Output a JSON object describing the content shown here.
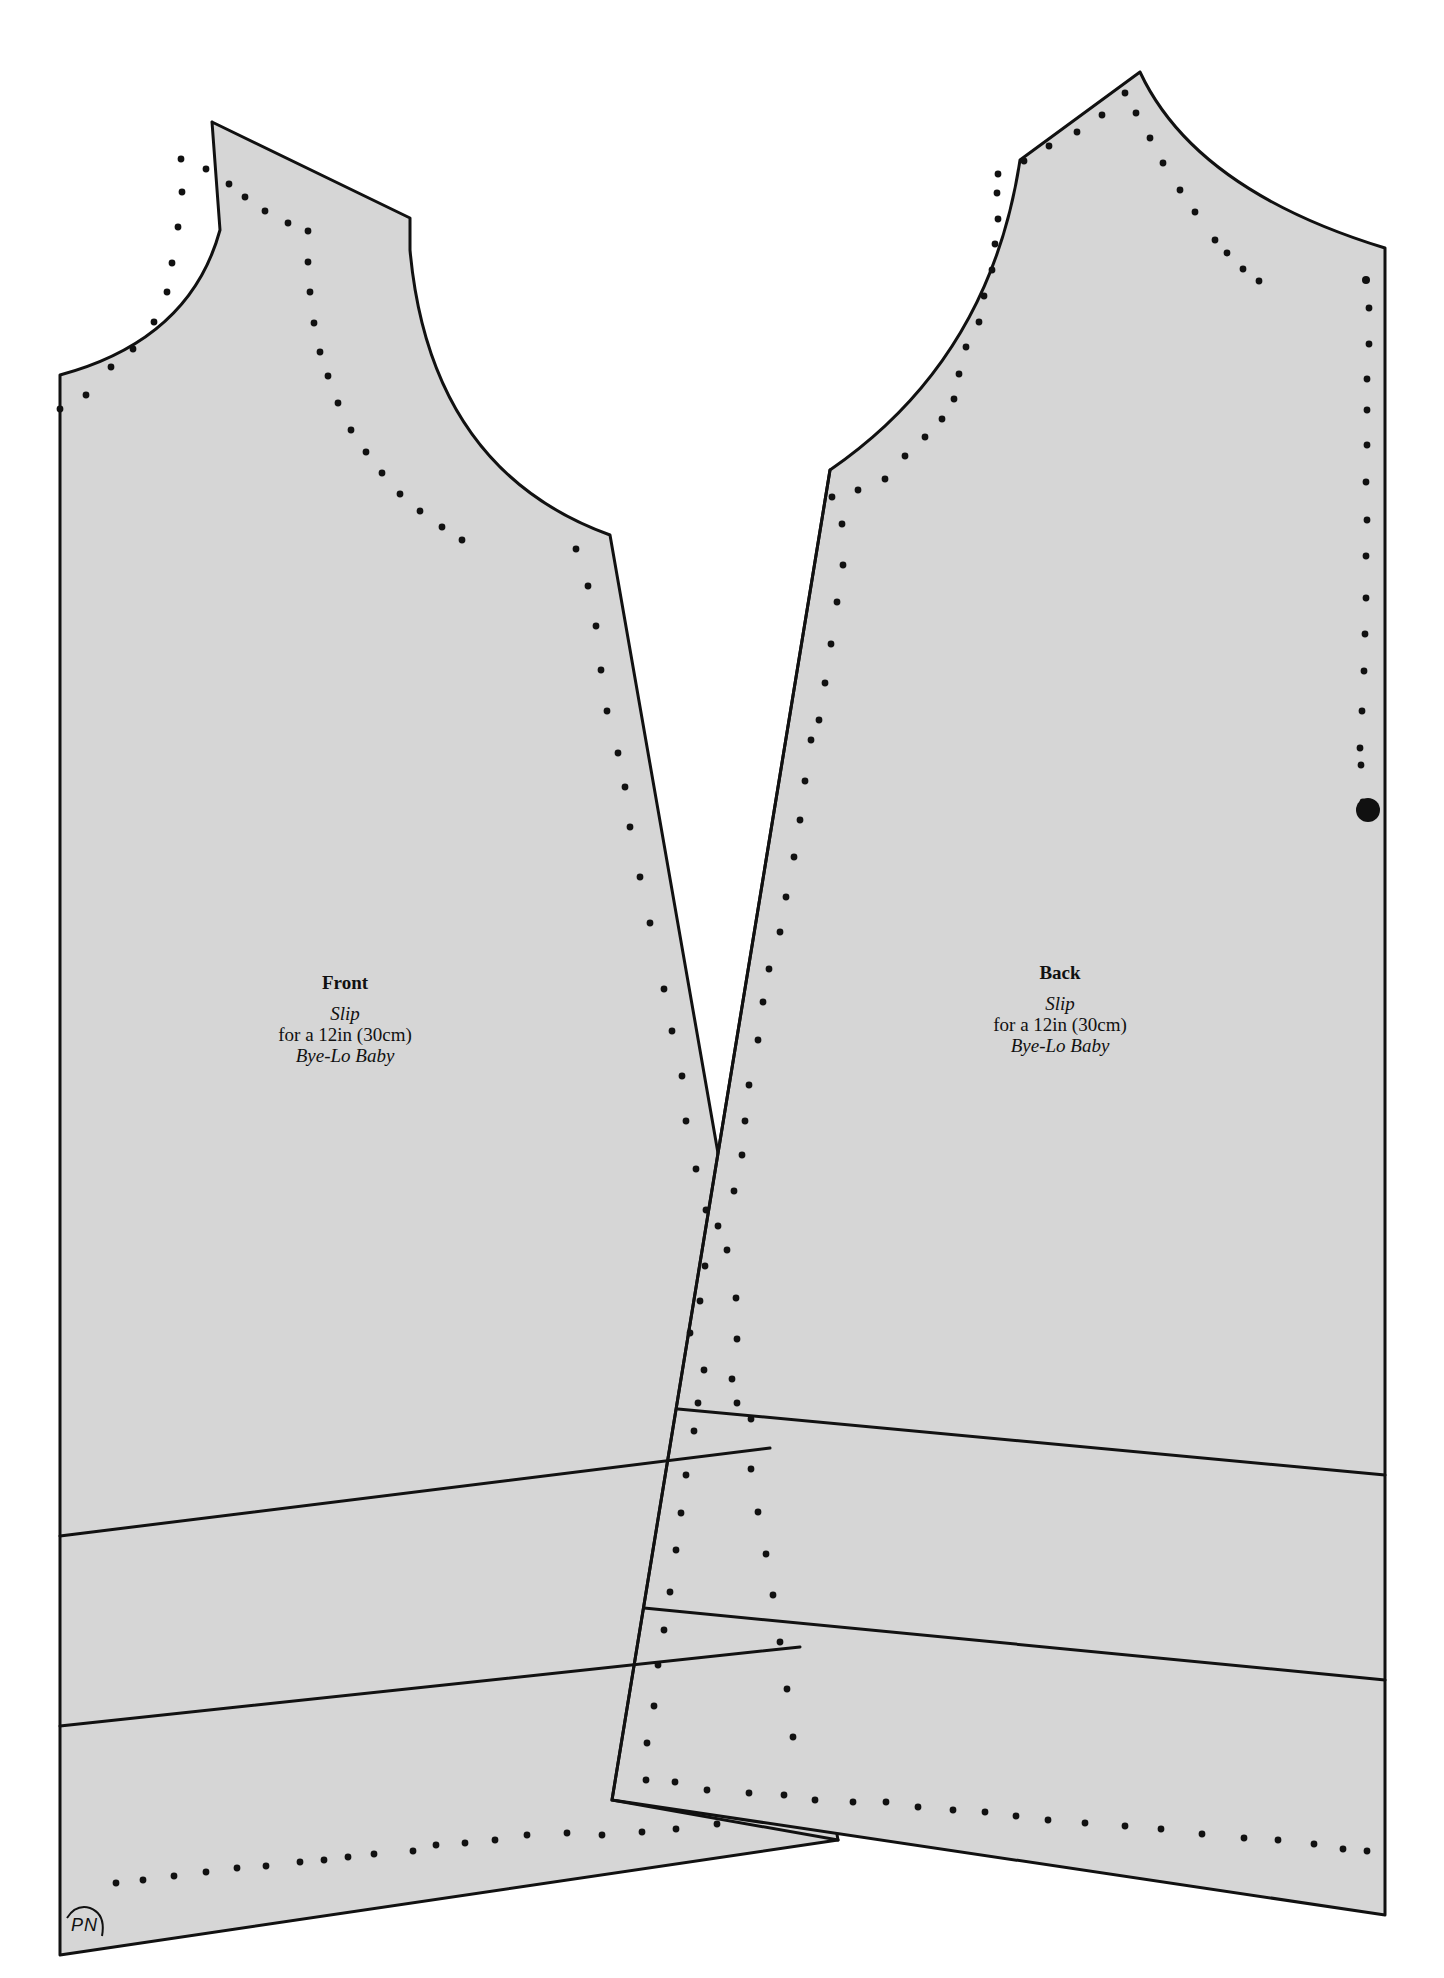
{
  "figure": {
    "type": "sewing-pattern",
    "colors": {
      "paper": "#ffffff",
      "piece_fill": "#d6d6d6",
      "line": "#111111"
    }
  },
  "pieces": [
    {
      "id": "front",
      "title": "Front",
      "garment": "Slip",
      "size_line": "for a 12in (30cm)",
      "doll": "Bye-Lo Baby"
    },
    {
      "id": "back",
      "title": "Back",
      "garment": "Slip",
      "size_line": "for a 12in (30cm)",
      "doll": "Bye-Lo Baby"
    }
  ],
  "markings": {
    "designer_initials": "PN",
    "circle_marker": "large-dot-notch"
  }
}
